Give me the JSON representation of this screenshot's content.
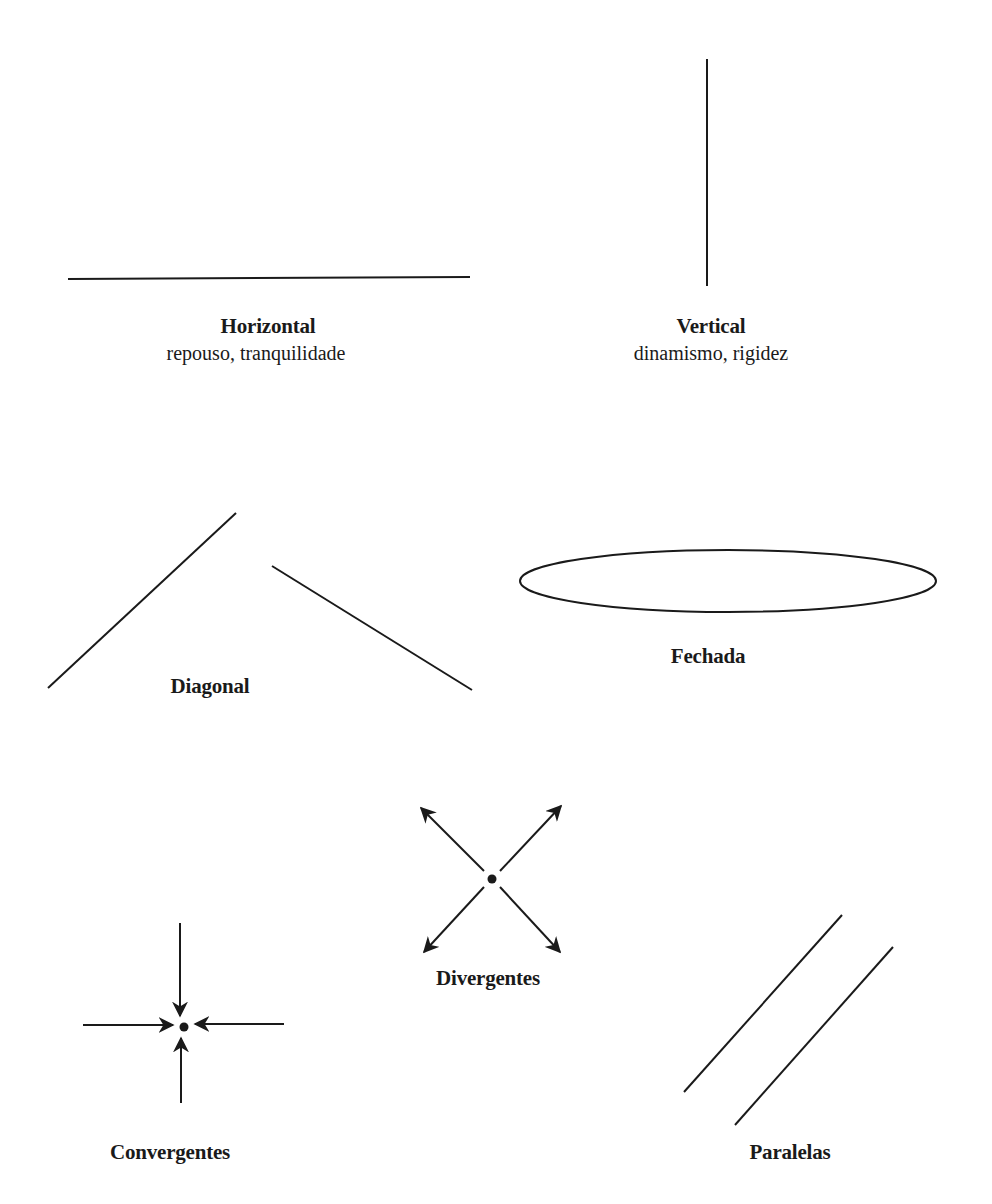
{
  "diagram": {
    "stroke_color": "#1a1a1a",
    "background": "#ffffff",
    "items": [
      {
        "id": "horizontal",
        "title": "Horizontal",
        "subtitle": "repouso, tranquilidade"
      },
      {
        "id": "vertical",
        "title": "Vertical",
        "subtitle": "dinamismo, rigidez"
      },
      {
        "id": "diagonal",
        "title": "Diagonal"
      },
      {
        "id": "fechada",
        "title": "Fechada"
      },
      {
        "id": "divergentes",
        "title": "Divergentes"
      },
      {
        "id": "convergentes",
        "title": "Convergentes"
      },
      {
        "id": "paralelas",
        "title": "Paralelas"
      }
    ]
  }
}
